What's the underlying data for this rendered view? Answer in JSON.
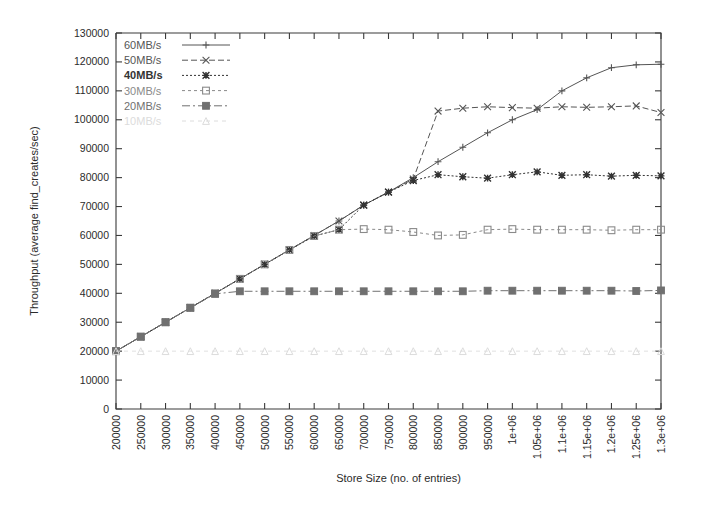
{
  "chart_data": {
    "type": "line",
    "title": "",
    "xlabel": "Store Size (no. of entries)",
    "ylabel": "Throughput (average find_creates/sec)",
    "grid": false,
    "legend_position": "top-left",
    "xlim": [
      200000,
      1300000
    ],
    "ylim": [
      0,
      130000
    ],
    "x": [
      200000,
      250000,
      300000,
      350000,
      400000,
      450000,
      500000,
      550000,
      600000,
      650000,
      700000,
      750000,
      800000,
      850000,
      900000,
      950000,
      1000000,
      1050000,
      1100000,
      1150000,
      1200000,
      1250000,
      1300000
    ],
    "xtick_labels": [
      "200000",
      "250000",
      "300000",
      "350000",
      "400000",
      "450000",
      "500000",
      "550000",
      "600000",
      "650000",
      "700000",
      "750000",
      "800000",
      "850000",
      "900000",
      "950000",
      "1e+06",
      "1.05e+06",
      "1.1e+06",
      "1.15e+06",
      "1.2e+06",
      "1.25e+06",
      "1.3e+06"
    ],
    "ytick_labels": [
      "0",
      "10000",
      "20000",
      "30000",
      "40000",
      "50000",
      "60000",
      "70000",
      "80000",
      "90000",
      "100000",
      "110000",
      "120000",
      "130000"
    ],
    "yticks": [
      0,
      10000,
      20000,
      30000,
      40000,
      50000,
      60000,
      70000,
      80000,
      90000,
      100000,
      110000,
      120000,
      130000
    ],
    "series": [
      {
        "name": "60MB/s",
        "marker": "plus",
        "dash": "none",
        "color": "#555555",
        "values": [
          20000,
          25000,
          30000,
          35000,
          40000,
          45000,
          50000,
          55000,
          60000,
          65000,
          70500,
          75000,
          80000,
          85500,
          90500,
          95500,
          100000,
          103500,
          110000,
          114500,
          118000,
          119000,
          119200
        ]
      },
      {
        "name": "50MB/s",
        "marker": "cross",
        "dash": "6,3",
        "color": "#555555",
        "values": [
          20000,
          25000,
          30000,
          35000,
          40000,
          45000,
          50000,
          55000,
          60000,
          65000,
          70500,
          75000,
          79500,
          103000,
          104000,
          104500,
          104200,
          104000,
          104500,
          104300,
          104500,
          104800,
          102500
        ]
      },
      {
        "name": "40MB/s",
        "marker": "star",
        "dash": "2,2",
        "color": "#333333",
        "values": [
          20000,
          25000,
          30000,
          35000,
          40000,
          45000,
          50000,
          55000,
          59800,
          62000,
          70500,
          75000,
          79000,
          81000,
          80300,
          79800,
          81000,
          82000,
          80800,
          81000,
          80500,
          80800,
          80600
        ]
      },
      {
        "name": "30MB/s",
        "marker": "square-open",
        "dash": "3,3",
        "color": "#8a8a8a",
        "values": [
          20000,
          25000,
          30000,
          35000,
          40000,
          45000,
          50000,
          55000,
          59800,
          62000,
          62200,
          62000,
          61200,
          60000,
          60200,
          62000,
          62200,
          62000,
          62000,
          62000,
          61800,
          62000,
          62000
        ]
      },
      {
        "name": "20MB/s",
        "marker": "square-filled",
        "dash": "8,3,2,3",
        "color": "#707070",
        "values": [
          20000,
          25000,
          30000,
          35000,
          39800,
          40700,
          40700,
          40700,
          40700,
          40700,
          40700,
          40700,
          40700,
          40700,
          40700,
          40900,
          40900,
          40900,
          40900,
          40900,
          40900,
          40800,
          41000
        ]
      },
      {
        "name": "10MB/s",
        "marker": "triangle-open",
        "dash": "4,4",
        "color": "#dcdcdc",
        "values": [
          20000,
          20000,
          20000,
          20000,
          20000,
          20000,
          20000,
          20000,
          20000,
          20000,
          20000,
          20000,
          20000,
          20000,
          20000,
          20000,
          20000,
          20000,
          20000,
          20000,
          20000,
          20000,
          20000
        ]
      }
    ],
    "legend_entries": [
      {
        "label": "60MB/s"
      },
      {
        "label": "50MB/s"
      },
      {
        "label": "40MB/s"
      },
      {
        "label": "30MB/s"
      },
      {
        "label": "20MB/s"
      },
      {
        "label": "10MB/s"
      }
    ]
  }
}
